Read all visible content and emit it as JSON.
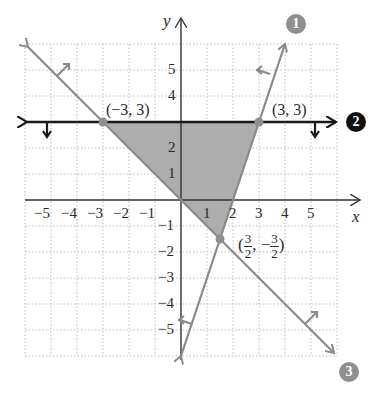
{
  "graph": {
    "axes": {
      "x_label": "x",
      "y_label": "y",
      "x_ticks": [
        "−5",
        "−4",
        "−3",
        "−2",
        "−1",
        "1",
        "2",
        "3",
        "4",
        "5"
      ],
      "y_ticks": [
        "5",
        "4",
        "2",
        "1",
        "−1",
        "−2",
        "−3",
        "−4",
        "−5"
      ],
      "range": {
        "xmin": -6,
        "xmax": 6,
        "ymin": -6,
        "ymax": 6
      },
      "grid": "dotted"
    },
    "points": [
      {
        "label": "(−3, 3)",
        "x": -3,
        "y": 3
      },
      {
        "label": "(3, 3)",
        "x": 3,
        "y": 3
      },
      {
        "label_num_x": "3",
        "label_den_x": "2",
        "label_num_y": "3",
        "label_den_y": "2",
        "label": "(3/2, −3/2)",
        "x": 1.5,
        "y": -1.5
      }
    ],
    "lines": [
      {
        "id": "1",
        "badge": "1",
        "equation": "y = 3x − 6",
        "color": "#8a8a8a",
        "shade_direction": "left/up"
      },
      {
        "id": "2",
        "badge": "2",
        "equation": "y = 3",
        "color": "#1a1a1a",
        "shade_direction": "below"
      },
      {
        "id": "3",
        "badge": "3",
        "equation": "y = −x",
        "color": "#8a8a8a",
        "shade_direction": "above"
      }
    ],
    "feasible_region": {
      "vertices": [
        [
          -3,
          3
        ],
        [
          3,
          3
        ],
        [
          1.5,
          -1.5
        ]
      ],
      "fill": "#a9a9a9"
    },
    "colors": {
      "gray_line": "#8a8a8a",
      "black_line": "#1a1a1a",
      "badge_gray": "#8f8f8f",
      "badge_black": "#111111",
      "axis": "#333333",
      "grid": "#bdbdbd"
    }
  }
}
